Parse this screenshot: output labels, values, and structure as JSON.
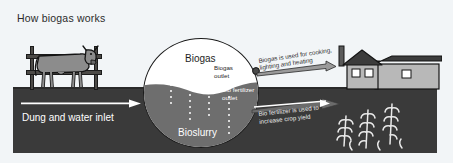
{
  "figure": {
    "title": "How biogas works",
    "background_color": "#f2f5f7",
    "ground_color": "#3a3a3a",
    "slurry_color": "#6e6e6e",
    "gas_space_color": "#ffffff",
    "outline_color": "#1a1a1a"
  },
  "labels": {
    "biogas": "Biogas",
    "bioslurry": "Bioslurry",
    "biogas_outlet": "Biogas\noutlet",
    "biogas_outlet_line1": "Biogas",
    "biogas_outlet_line2": "outlet",
    "biofertilizer_outlet_line1": "Bio fertilizer",
    "biofertilizer_outlet_line2": "outlet",
    "dung_inlet": "Dung and water inlet",
    "gas_use_line1": "Biogas is used for cooking,",
    "gas_use_line2": "lighting and heating",
    "fertilizer_use_line1": "Bio fertilizer is used to",
    "fertilizer_use_line2": "increase crop yield"
  },
  "scene": {
    "cow_label": "cow",
    "fence_label": "fence",
    "house_label": "farmhouse",
    "crops_label": "crop field",
    "digester_label": "biogas digester"
  },
  "icons": {
    "inlet_arrow": "arrow-right-icon",
    "gas_arrow": "arrow-right-icon",
    "fertilizer_arrow": "arrow-right-icon"
  }
}
